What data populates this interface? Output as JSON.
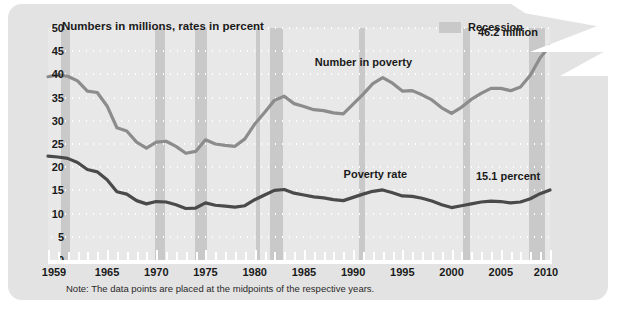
{
  "title": "Numbers in millions, rates in percent",
  "legend": {
    "swatch_label": "Recession",
    "swatch_color": "#c9c9c9"
  },
  "annotations": {
    "number_series_label": "Number in poverty",
    "rate_series_label": "Poverty rate",
    "number_end_label": "46.2 million",
    "rate_end_label": "15.1 percent"
  },
  "note": "Note: The data points are placed at the midpoints of the respective years.",
  "colors": {
    "card": "#e3e3e3",
    "plot": "#e8e8e8",
    "recession": "#c9c9c9",
    "number_line": "#8c8c8c",
    "rate_line": "#4a4a4a",
    "grid": "#ffffff",
    "text": "#1a1a1a"
  },
  "chart_data": {
    "type": "line",
    "title": "Numbers in millions, rates in percent",
    "xlabel": "",
    "ylabel": "",
    "xlim": [
      1959,
      2010
    ],
    "ylim": [
      0,
      50
    ],
    "ytick_step": 5,
    "yticks": [
      0,
      5,
      10,
      15,
      20,
      25,
      30,
      35,
      40,
      45,
      50
    ],
    "xticks": [
      1959,
      1965,
      1970,
      1975,
      1980,
      1985,
      1990,
      1995,
      2000,
      2005,
      2010
    ],
    "xtick_labels": [
      "1959",
      "1965",
      "1970",
      "1975",
      "1980",
      "1985",
      "1990",
      "1995",
      "2000",
      "2005",
      "2010"
    ],
    "grid": "dotted-horizontal",
    "legend_position": "top-right",
    "x": [
      1959,
      1960,
      1961,
      1962,
      1963,
      1964,
      1965,
      1966,
      1967,
      1968,
      1969,
      1970,
      1971,
      1972,
      1973,
      1974,
      1975,
      1976,
      1977,
      1978,
      1979,
      1980,
      1981,
      1982,
      1983,
      1984,
      1985,
      1986,
      1987,
      1988,
      1989,
      1990,
      1991,
      1992,
      1993,
      1994,
      1995,
      1996,
      1997,
      1998,
      1999,
      2000,
      2001,
      2002,
      2003,
      2004,
      2005,
      2006,
      2007,
      2008,
      2009,
      2010
    ],
    "series": [
      {
        "name": "Number in poverty",
        "units": "millions",
        "color": "#8c8c8c",
        "end_label": "46.2 million",
        "values": [
          39.5,
          39.9,
          39.6,
          38.6,
          36.4,
          36.1,
          33.2,
          28.5,
          27.8,
          25.4,
          24.1,
          25.4,
          25.6,
          24.5,
          23.0,
          23.4,
          25.9,
          25.0,
          24.7,
          24.5,
          26.1,
          29.3,
          31.8,
          34.4,
          35.3,
          33.7,
          33.1,
          32.4,
          32.2,
          31.7,
          31.5,
          33.6,
          35.7,
          38.0,
          39.3,
          38.1,
          36.4,
          36.5,
          35.6,
          34.5,
          32.8,
          31.6,
          32.9,
          34.6,
          35.9,
          37.0,
          37.0,
          36.5,
          37.3,
          39.8,
          43.6,
          46.2
        ]
      },
      {
        "name": "Poverty rate",
        "units": "percent",
        "color": "#4a4a4a",
        "end_label": "15.1 percent",
        "values": [
          22.4,
          22.2,
          21.9,
          21.0,
          19.5,
          19.0,
          17.3,
          14.7,
          14.2,
          12.8,
          12.1,
          12.6,
          12.5,
          11.9,
          11.1,
          11.2,
          12.3,
          11.8,
          11.6,
          11.4,
          11.7,
          13.0,
          14.0,
          15.0,
          15.2,
          14.4,
          14.0,
          13.6,
          13.4,
          13.0,
          12.8,
          13.5,
          14.2,
          14.8,
          15.1,
          14.5,
          13.8,
          13.7,
          13.3,
          12.7,
          11.9,
          11.3,
          11.7,
          12.1,
          12.5,
          12.7,
          12.6,
          12.3,
          12.5,
          13.2,
          14.3,
          15.1
        ]
      }
    ],
    "recessions": [
      {
        "start": 1960.3,
        "end": 1961.2
      },
      {
        "start": 1969.9,
        "end": 1970.9
      },
      {
        "start": 1973.9,
        "end": 1975.2
      },
      {
        "start": 1980.1,
        "end": 1980.5
      },
      {
        "start": 1981.6,
        "end": 1982.9
      },
      {
        "start": 1990.6,
        "end": 1991.2
      },
      {
        "start": 2001.2,
        "end": 2001.9
      },
      {
        "start": 2007.9,
        "end": 2009.5
      }
    ]
  }
}
